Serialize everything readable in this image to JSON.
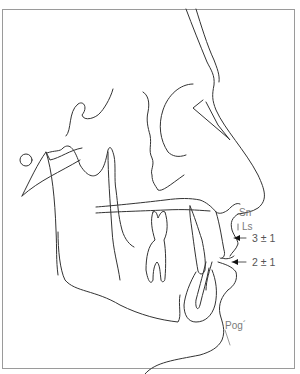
{
  "diagram": {
    "type": "cephalometric soft-tissue profile tracing",
    "landmarks": {
      "sn": "Sn",
      "ls": "Ls",
      "pog": "Pog´"
    },
    "measurements": [
      {
        "label": "3 ± 1",
        "target": "upper lip (Ls) to E-line"
      },
      {
        "label": "2 ± 1",
        "target": "lower lip to E-line"
      }
    ],
    "colors": {
      "line": "#333333",
      "label": "#7a7a7a",
      "frame": "#9a9a9a",
      "background": "#ffffff"
    }
  }
}
